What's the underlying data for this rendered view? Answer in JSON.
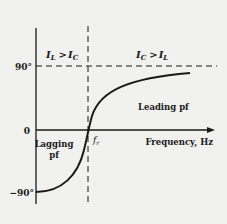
{
  "diagram": {
    "y_ticks": [
      {
        "label": "90°",
        "value": 90
      },
      {
        "label": "0",
        "value": 0
      },
      {
        "label": "−90°",
        "value": -90
      }
    ],
    "x_axis_label": "Frequency, Hz",
    "resonance_label": "f",
    "resonance_sub": "r",
    "regions": {
      "left_condition": {
        "a": "I",
        "a_sub": "L",
        "op": ">",
        "b": "I",
        "b_sub": "C"
      },
      "right_condition": {
        "a": "I",
        "a_sub": "C",
        "op": ">",
        "b": "I",
        "b_sub": "L"
      },
      "lagging_line1": "Lagging",
      "lagging_line2": "pf",
      "leading": "Leading pf"
    },
    "colors": {
      "background": "#f1f1ef",
      "ink": "#1a1a1a"
    }
  }
}
